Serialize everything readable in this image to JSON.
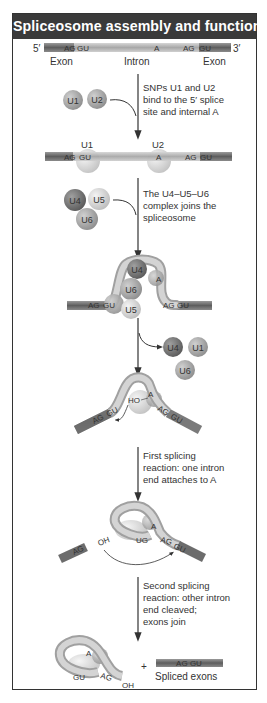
{
  "title": "Spliceosome assembly and function",
  "pre_mrna": {
    "five_prime": "5′",
    "three_prime": "3′",
    "seq_left": "AG",
    "seq_left_gu": "GU",
    "seq_branch": "A",
    "seq_right": "AG",
    "seq_right_gu": "GU",
    "labels": {
      "exon_left": "Exon",
      "intron": "Intron",
      "exon_right": "Exon"
    }
  },
  "steps": [
    {
      "text_lines": [
        "SNPs U1 and U2",
        "bind to the 5′ splice",
        "site and internal A"
      ]
    },
    {
      "text_lines": [
        "The U4–U5–U6",
        "complex joins the",
        "spliceosome"
      ]
    },
    {
      "text_lines": []
    },
    {
      "text_lines": [
        "First splicing",
        "reaction: one intron",
        "end attaches to A"
      ]
    },
    {
      "text_lines": [
        "Second splicing",
        "reaction: other intron",
        "end cleaved;",
        "exons join"
      ]
    }
  ],
  "snrnps": {
    "u1": "U1",
    "u2": "U2",
    "u4": "U4",
    "u5": "U5",
    "u6": "U6"
  },
  "labels": {
    "ho": "HO",
    "oh": "OH",
    "ug": "UG",
    "plus": "+",
    "spliced_exons": "Spliced exons",
    "spliced_seq": "AG GU"
  },
  "colors": {
    "header_bg": "#3a3a3a",
    "u1": "#a8a8a8",
    "u2": "#b4b4b4",
    "u4": "#7a7a7a",
    "u5": "#dedede",
    "u6": "#c4c4c4",
    "exon": "#6e6e6e",
    "intron": "#b8b8b8"
  }
}
